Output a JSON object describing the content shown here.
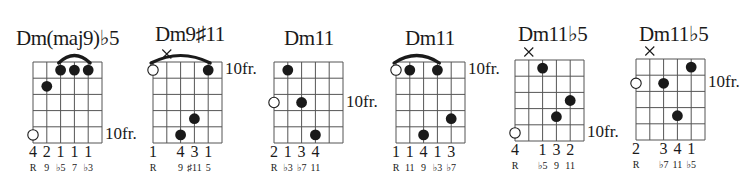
{
  "layout": {
    "string_spacing": 13.8,
    "fret_spacing": 16.2,
    "frets_shown": 5,
    "strings": 6
  },
  "colors": {
    "ink": "#1a1a1a",
    "background": "#ffffff",
    "grid": "#555555"
  },
  "chords": [
    {
      "name": "Dm(maj9)♭5",
      "title_x": 16,
      "grid_x": 33,
      "grid_y": 62,
      "fret_label": "10fr.",
      "fret_label_fret": 5,
      "muted": [],
      "open_dots": [
        {
          "string": 1,
          "fret": 5
        }
      ],
      "dots": [
        {
          "string": 2,
          "fret": 2
        },
        {
          "string": 3,
          "fret": 1
        },
        {
          "string": 4,
          "fret": 1
        },
        {
          "string": 5,
          "fret": 1
        }
      ],
      "barre": {
        "from": 3,
        "to": 5
      },
      "fingers": [
        "4",
        "2",
        "1",
        "1",
        "1",
        ""
      ],
      "intervals": [
        "R",
        "9",
        "♭5",
        "7",
        "♭3",
        ""
      ]
    },
    {
      "name": "Dm9♯11",
      "title_x": 155,
      "grid_x": 153,
      "grid_y": 62,
      "fret_label": "10fr.",
      "fret_label_fret": 1,
      "muted": [
        2
      ],
      "open_dots": [
        {
          "string": 1,
          "fret": 1
        }
      ],
      "dots": [
        {
          "string": 5,
          "fret": 1
        },
        {
          "string": 3,
          "fret": 5
        },
        {
          "string": 4,
          "fret": 4
        }
      ],
      "barre": {
        "from": 1,
        "to": 5
      },
      "fingers": [
        "1",
        "",
        "4",
        "3",
        "1",
        ""
      ],
      "intervals": [
        "R",
        "",
        "9",
        "♯11",
        "5",
        ""
      ]
    },
    {
      "name": "Dm11",
      "title_x": 284,
      "grid_x": 274,
      "grid_y": 62,
      "fret_label": "10fr.",
      "fret_label_fret": 3,
      "muted": [],
      "open_dots": [
        {
          "string": 1,
          "fret": 3
        }
      ],
      "dots": [
        {
          "string": 2,
          "fret": 1
        },
        {
          "string": 3,
          "fret": 3
        },
        {
          "string": 4,
          "fret": 5
        }
      ],
      "barre": null,
      "fingers": [
        "2",
        "1",
        "3",
        "4",
        "",
        ""
      ],
      "intervals": [
        "R",
        "♭3",
        "♭7",
        "11",
        "",
        ""
      ]
    },
    {
      "name": "Dm11",
      "title_x": 405,
      "grid_x": 396,
      "grid_y": 62,
      "fret_label": "10fr.",
      "fret_label_fret": 1,
      "muted": [],
      "open_dots": [
        {
          "string": 1,
          "fret": 1
        }
      ],
      "dots": [
        {
          "string": 2,
          "fret": 1
        },
        {
          "string": 4,
          "fret": 1
        },
        {
          "string": 5,
          "fret": 4
        },
        {
          "string": 3,
          "fret": 5
        }
      ],
      "barre": {
        "from": 1,
        "to": 4
      },
      "fingers": [
        "1",
        "1",
        "4",
        "1",
        "3",
        ""
      ],
      "intervals": [
        "R",
        "11",
        "9",
        "♭3",
        "♭7",
        ""
      ]
    },
    {
      "name": "Dm11♭5",
      "title_x": 518,
      "grid_x": 515,
      "grid_y": 60,
      "fret_label": "10fr.",
      "fret_label_fret": 5,
      "muted": [
        2
      ],
      "open_dots": [
        {
          "string": 1,
          "fret": 5
        }
      ],
      "dots": [
        {
          "string": 3,
          "fret": 1
        },
        {
          "string": 5,
          "fret": 3
        },
        {
          "string": 4,
          "fret": 4
        }
      ],
      "barre": null,
      "fingers": [
        "4",
        "",
        "1",
        "3",
        "2",
        ""
      ],
      "intervals": [
        "R",
        "",
        "♭5",
        "9",
        "11",
        ""
      ]
    },
    {
      "name": "Dm11♭5",
      "title_x": 639,
      "grid_x": 636,
      "grid_y": 59,
      "fret_label": "10fr.",
      "fret_label_fret": 2,
      "muted": [
        2
      ],
      "open_dots": [
        {
          "string": 1,
          "fret": 2
        }
      ],
      "dots": [
        {
          "string": 5,
          "fret": 1
        },
        {
          "string": 3,
          "fret": 2
        },
        {
          "string": 4,
          "fret": 4
        }
      ],
      "barre": null,
      "fingers": [
        "2",
        "",
        "3",
        "4",
        "1",
        ""
      ],
      "intervals": [
        "R",
        "",
        "♭7",
        "11",
        "♭5",
        ""
      ]
    }
  ]
}
